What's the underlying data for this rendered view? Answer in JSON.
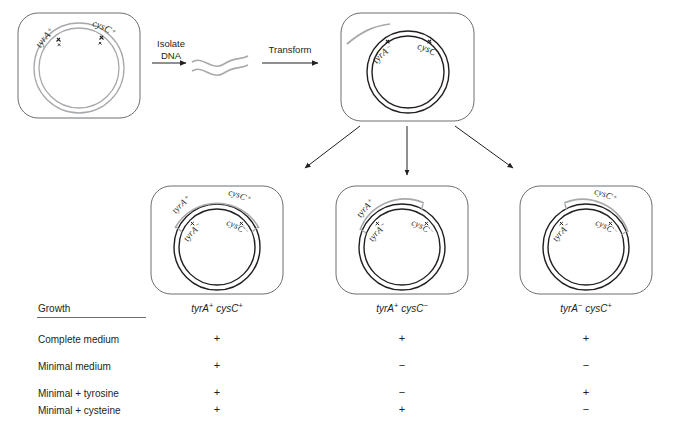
{
  "process": {
    "isolate": "Isolate\nDNA",
    "isolate_line1": "Isolate",
    "isolate_line2": "DNA",
    "transform": "Transform"
  },
  "cells": {
    "donor": {
      "name": "donor-cell",
      "markers": [
        {
          "gene": "tyrA",
          "sign": "+"
        },
        {
          "gene": "cysC",
          "sign": "+"
        }
      ],
      "chromosome_color": "#a7a9ac"
    },
    "recipient": {
      "name": "recipient-cell",
      "markers": [
        {
          "gene": "tyrA",
          "sign": "−"
        },
        {
          "gene": "cysC",
          "sign": "−"
        }
      ],
      "chromosome_color": "#231f20",
      "donor_fragment_color": "#a7a9ac"
    },
    "outcomes": [
      {
        "name": "outcome-double-transformant",
        "donor_markers": [
          {
            "gene": "tyrA",
            "sign": "+"
          },
          {
            "gene": "cysC",
            "sign": "+"
          }
        ],
        "host_markers": [
          {
            "gene": "tyrA",
            "sign": "−"
          },
          {
            "gene": "cysC",
            "sign": "−"
          }
        ],
        "genotype_gene1": "tyrA",
        "genotype_sign1": "+",
        "genotype_gene2": "cysC",
        "genotype_sign2": "+"
      },
      {
        "name": "outcome-tyrA-transformant",
        "donor_markers": [
          {
            "gene": "tyrA",
            "sign": "+"
          }
        ],
        "host_markers": [
          {
            "gene": "tyrA",
            "sign": "−"
          },
          {
            "gene": "cysC",
            "sign": "−"
          }
        ],
        "genotype_gene1": "tyrA",
        "genotype_sign1": "+",
        "genotype_gene2": "cysC",
        "genotype_sign2": "−"
      },
      {
        "name": "outcome-cysC-transformant",
        "donor_markers": [
          {
            "gene": "cysC",
            "sign": "+"
          }
        ],
        "host_markers": [
          {
            "gene": "tyrA",
            "sign": "−"
          },
          {
            "gene": "cysC",
            "sign": "−"
          }
        ],
        "genotype_gene1": "tyrA",
        "genotype_sign1": "−",
        "genotype_gene2": "cysC",
        "genotype_sign2": "+"
      }
    ]
  },
  "table": {
    "header": "Growth",
    "rows": [
      {
        "label": "Complete medium",
        "values": [
          "+",
          "+",
          "+"
        ]
      },
      {
        "label": "Minimal medium",
        "values": [
          "+",
          "−",
          "−"
        ]
      },
      {
        "label": "Minimal + tyrosine",
        "values": [
          "+",
          "−",
          "+"
        ]
      },
      {
        "label": "Minimal + cysteine",
        "values": [
          "+",
          "+",
          "−"
        ]
      }
    ]
  },
  "colors": {
    "donor_dna": "#a7a9ac",
    "host_dna": "#231f20",
    "cell_outline": "#6d6e70",
    "text": "#231f20",
    "rule": "#6d6e70"
  }
}
